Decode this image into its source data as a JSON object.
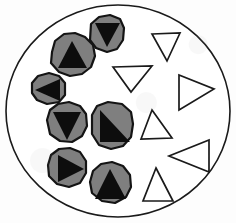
{
  "figure": {
    "type": "diagram",
    "width": 236,
    "height": 223,
    "background_color": "#ffffff"
  },
  "colors": {
    "outline": "#1a1a1a",
    "blob_fill": "#7f7f7f",
    "core_fill": "#0d0d0d",
    "open_fill": "#ffffff",
    "page": "#ffffff"
  },
  "container": {
    "shape": "circle",
    "center_x": 118,
    "center_y": 111,
    "radius_x": 112,
    "radius_y": 106,
    "stroke": "#1a1a1a",
    "stroke_width": 1.6,
    "fill": "#ffffff"
  },
  "blobs": [
    {
      "id": "blob-top",
      "orientation": "down",
      "center_x": 105,
      "center_y": 33,
      "outline": "91,24 99,17 110,15 120,19 124,28 123,40 117,49 107,52 96,48 90,40",
      "core": "95,23 120,23 107,47"
    },
    {
      "id": "blob-upper-left",
      "orientation": "up",
      "center_x": 72,
      "center_y": 57,
      "outline": "52,52 55,41 64,34 75,33 85,37 93,45 95,56 91,67 82,74 70,76 59,72 51,63",
      "core": "58,68 87,68 72,41"
    },
    {
      "id": "blob-left",
      "orientation": "left",
      "center_x": 47,
      "center_y": 89,
      "outline": "32,83 38,76 49,73 59,76 65,83 65,95 59,102 47,104 37,100 32,93",
      "core": "60,79 60,101 35,90"
    },
    {
      "id": "blob-mid-left",
      "orientation": "down",
      "center_x": 66,
      "center_y": 125,
      "outline": "47,120 50,110 58,104 69,102 80,106 86,114 87,126 82,136 72,142 60,141 50,134",
      "core": "53,112 81,112 67,140"
    },
    {
      "id": "blob-center",
      "orientation": "right-angle",
      "center_x": 111,
      "center_y": 127,
      "outline": "92,115 97,106 108,102 122,104 131,112 133,124 131,137 123,146 111,149 99,145 92,134",
      "core": "100,110 100,142 130,142"
    },
    {
      "id": "blob-lower-left",
      "orientation": "right",
      "center_x": 66,
      "center_y": 169,
      "outline": "48,165 51,155 59,149 70,148 80,152 86,161 86,173 80,183 69,187 57,184 49,176",
      "core": "58,155 58,182 84,169"
    },
    {
      "id": "blob-bottom",
      "orientation": "up",
      "center_x": 110,
      "center_y": 186,
      "outline": "90,182 93,171 101,164 112,162 123,166 130,175 131,187 126,197 115,203 102,201 92,193",
      "core": "95,199 126,199 110,169"
    }
  ],
  "open_triangles": [
    {
      "id": "triangle-top-right",
      "orientation": "up",
      "points": "152,34 180,33 167,61"
    },
    {
      "id": "triangle-upper-mid",
      "orientation": "down",
      "points": "113,67 152,66 131,92"
    },
    {
      "id": "triangle-right",
      "orientation": "right",
      "points": "179,75 179,110 214,89"
    },
    {
      "id": "triangle-mid-right",
      "orientation": "up",
      "points": "152,110 172,138 141,139"
    },
    {
      "id": "triangle-lower-right",
      "orientation": "left",
      "points": "209,140 209,172 169,156"
    },
    {
      "id": "triangle-bottom",
      "orientation": "up",
      "points": "156,168 173,201 143,201"
    }
  ],
  "counts": {
    "blobs": 7,
    "open_triangles": 6
  }
}
